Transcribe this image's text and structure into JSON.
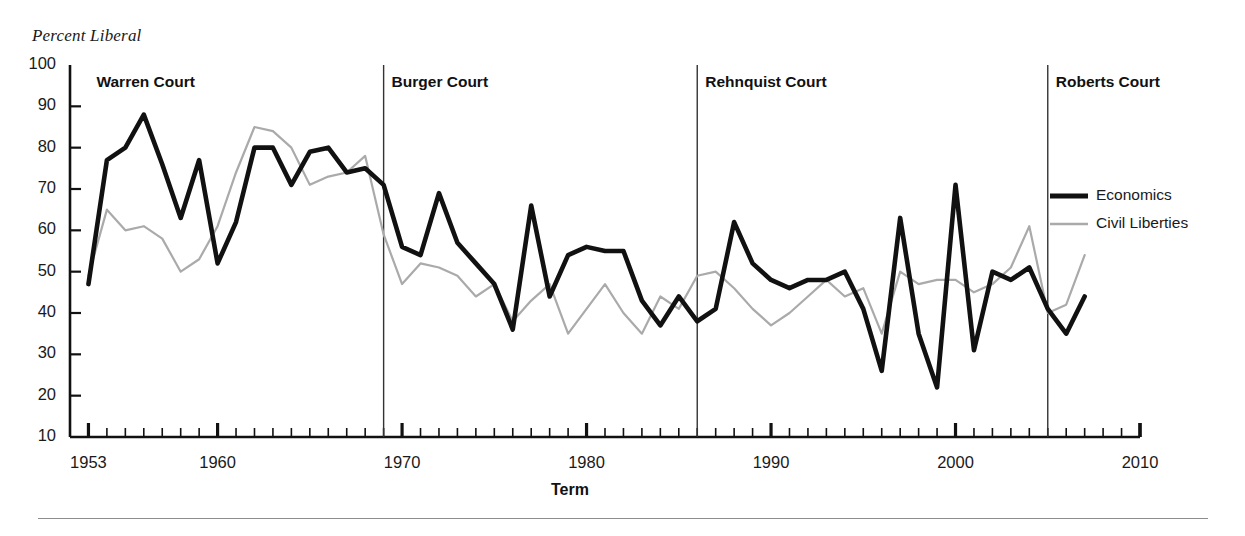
{
  "axis_note": "Percent Liberal",
  "xaxis": {
    "title": "Term",
    "ticks": [
      1953,
      1960,
      1970,
      1980,
      1990,
      2000,
      2010
    ],
    "range": [
      1952,
      2010
    ],
    "minor_tick_step": 1
  },
  "yaxis": {
    "title": "Percent Liberal",
    "ticks": [
      10,
      20,
      30,
      40,
      50,
      60,
      70,
      80,
      90,
      100
    ],
    "range": [
      10,
      100
    ]
  },
  "eras": [
    {
      "name": "Warren Court",
      "start": 1953,
      "divider_year": null
    },
    {
      "name": "Burger Court",
      "start": 1969,
      "divider_year": 1969
    },
    {
      "name": "Rehnquist Court",
      "start": 1986,
      "divider_year": 1986
    },
    {
      "name": "Roberts Court",
      "start": 2005,
      "divider_year": 2005
    }
  ],
  "legend": {
    "position": "right",
    "items": [
      {
        "label": "Economics",
        "color": "#111111",
        "width": 4.5
      },
      {
        "label": "Civil Liberties",
        "color": "#aaaaaa",
        "width": 2.2
      }
    ]
  },
  "chart_data": {
    "type": "line",
    "title": "",
    "subtitle": "",
    "xlabel": "Term",
    "ylabel": "Percent Liberal",
    "xlim": [
      1952,
      2010
    ],
    "ylim": [
      10,
      100
    ],
    "grid": false,
    "legend_position": "right",
    "x": [
      1953,
      1954,
      1955,
      1956,
      1957,
      1958,
      1959,
      1960,
      1961,
      1962,
      1963,
      1964,
      1965,
      1966,
      1967,
      1968,
      1969,
      1970,
      1971,
      1972,
      1973,
      1974,
      1975,
      1976,
      1977,
      1978,
      1979,
      1980,
      1981,
      1982,
      1983,
      1984,
      1985,
      1986,
      1987,
      1988,
      1989,
      1990,
      1991,
      1992,
      1993,
      1994,
      1995,
      1996,
      1997,
      1998,
      1999,
      2000,
      2001,
      2002,
      2003,
      2004,
      2005,
      2006,
      2007
    ],
    "series": [
      {
        "name": "Economics",
        "color": "#111111",
        "values": [
          47,
          77,
          80,
          88,
          76,
          63,
          77,
          52,
          62,
          80,
          80,
          71,
          79,
          80,
          74,
          75,
          71,
          56,
          54,
          69,
          57,
          52,
          47,
          36,
          66,
          44,
          54,
          56,
          55,
          55,
          43,
          37,
          44,
          38,
          41,
          62,
          52,
          48,
          46,
          48,
          48,
          50,
          41,
          26,
          63,
          35,
          22,
          71,
          31,
          50,
          48,
          51,
          41,
          35,
          44
        ]
      },
      {
        "name": "Civil Liberties",
        "color": "#aaaaaa",
        "values": [
          49,
          65,
          60,
          61,
          58,
          50,
          53,
          61,
          74,
          85,
          84,
          80,
          71,
          73,
          74,
          78,
          59,
          47,
          52,
          51,
          49,
          44,
          47,
          38,
          43,
          47,
          35,
          41,
          47,
          40,
          35,
          44,
          41,
          49,
          50,
          46,
          41,
          37,
          40,
          44,
          48,
          44,
          46,
          35,
          50,
          47,
          48,
          48,
          45,
          47,
          51,
          61,
          40,
          42,
          54
        ]
      }
    ]
  }
}
